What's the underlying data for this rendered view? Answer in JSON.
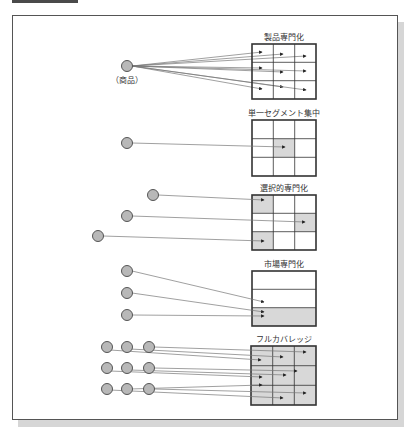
{
  "figure": {
    "colors": {
      "circle_fill": "#b8b8b8",
      "circle_stroke": "#555555",
      "shade": "#d8d8d8",
      "grid_stroke": "#333333",
      "line": "#777777"
    },
    "panels": [
      {
        "id": "product-specialization",
        "title": "製品専門化",
        "circle_label": "（商品）",
        "grid": {
          "x": 252,
          "y": 44,
          "w": 64,
          "h": 55,
          "rows": 3,
          "cols": 3,
          "shaded": []
        },
        "circles": [
          {
            "x": 127,
            "y": 66
          }
        ],
        "targets": [
          [
            0,
            0
          ],
          [
            0,
            1
          ],
          [
            0,
            2
          ],
          [
            1,
            0
          ],
          [
            1,
            1
          ],
          [
            1,
            2
          ],
          [
            2,
            0
          ],
          [
            2,
            1
          ],
          [
            2,
            2
          ]
        ]
      },
      {
        "id": "single-segment-concentration",
        "title": "単一セグメント集中",
        "grid": {
          "x": 252,
          "y": 120,
          "w": 64,
          "h": 56,
          "rows": 3,
          "cols": 3,
          "shaded": [
            [
              1,
              1
            ]
          ]
        },
        "circles": [
          {
            "x": 127,
            "y": 143
          }
        ],
        "targets": [
          [
            1,
            1
          ]
        ]
      },
      {
        "id": "selective-specialization",
        "title": "選択的専門化",
        "grid": {
          "x": 252,
          "y": 195,
          "w": 64,
          "h": 55,
          "rows": 3,
          "cols": 3,
          "shaded": [
            [
              0,
              0
            ],
            [
              1,
              2
            ],
            [
              2,
              0
            ]
          ]
        },
        "circles": [
          {
            "x": 153,
            "y": 195
          },
          {
            "x": 127,
            "y": 216
          },
          {
            "x": 98,
            "y": 236
          }
        ],
        "targets": [
          [
            0,
            0
          ],
          [
            1,
            2
          ],
          [
            2,
            0
          ]
        ]
      },
      {
        "id": "market-specialization",
        "title": "市場専門化",
        "grid": {
          "x": 252,
          "y": 271,
          "w": 64,
          "h": 55,
          "rows": 3,
          "cols": 1,
          "shaded": [
            [
              2,
              0
            ]
          ]
        },
        "circles": [
          {
            "x": 127,
            "y": 271
          },
          {
            "x": 127,
            "y": 293
          },
          {
            "x": 127,
            "y": 315
          }
        ]
      },
      {
        "id": "full-coverage",
        "title": "フルカバレッジ",
        "grid": {
          "x": 251,
          "y": 346,
          "w": 65,
          "h": 59,
          "rows": 3,
          "cols": 3,
          "shaded": "all"
        },
        "circles": [
          {
            "x": 107,
            "y": 347
          },
          {
            "x": 127,
            "y": 347
          },
          {
            "x": 149,
            "y": 347
          },
          {
            "x": 107,
            "y": 368
          },
          {
            "x": 127,
            "y": 368
          },
          {
            "x": 149,
            "y": 368
          },
          {
            "x": 107,
            "y": 389
          },
          {
            "x": 127,
            "y": 389
          },
          {
            "x": 149,
            "y": 389
          }
        ]
      }
    ]
  }
}
